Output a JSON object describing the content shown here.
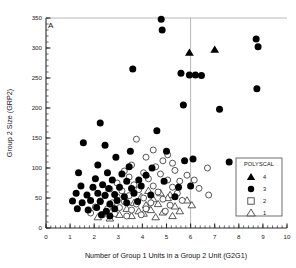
{
  "panel": {
    "label": "A"
  },
  "chart_data": {
    "type": "scatter",
    "title": "",
    "xlabel": "Number of Group 1 Units in a Group 2 Unit (G2G1)",
    "ylabel": "Group 2 Size (GRP2)",
    "xlim": [
      0,
      10
    ],
    "ylim": [
      0,
      350
    ],
    "xticks": [
      0,
      1,
      2,
      3,
      4,
      5,
      6,
      7,
      8,
      9,
      10
    ],
    "yticks": [
      0,
      50,
      100,
      150,
      200,
      250,
      300,
      350
    ],
    "xtick_labels": [
      "0",
      "1",
      "2",
      "3",
      "4",
      "5",
      "6",
      "7",
      "8",
      "9",
      "10"
    ],
    "ytick_labels": [
      "0",
      "50",
      "100",
      "150",
      "200",
      "250",
      "300",
      "350"
    ],
    "xminor_step": 0.2,
    "yminor_step": 10,
    "grid": false,
    "reference_lines": [
      {
        "orientation": "vertical",
        "x": 6,
        "color": "#b0b0b0"
      }
    ],
    "legend": {
      "title": "POLYSCAL",
      "position": "lower-right",
      "entries": [
        {
          "label": "4",
          "marker": "filled-triangle",
          "color": "#000000"
        },
        {
          "label": "3",
          "marker": "filled-circle",
          "color": "#000000"
        },
        {
          "label": "2",
          "marker": "open-square",
          "color": "#ffffff"
        },
        {
          "label": "1",
          "marker": "open-triangle",
          "color": "#ffffff"
        }
      ]
    },
    "series": [
      {
        "name": "4",
        "marker": "filled-triangle",
        "points": [
          [
            5.95,
            292
          ],
          [
            7.0,
            297
          ]
        ]
      },
      {
        "name": "3",
        "marker": "filled-circle",
        "points": [
          [
            4.78,
            348
          ],
          [
            4.82,
            330
          ],
          [
            8.72,
            315
          ],
          [
            8.8,
            302
          ],
          [
            3.6,
            265
          ],
          [
            5.6,
            258
          ],
          [
            5.95,
            255
          ],
          [
            6.2,
            255
          ],
          [
            6.45,
            254
          ],
          [
            8.75,
            232
          ],
          [
            5.7,
            205
          ],
          [
            7.2,
            198
          ],
          [
            2.25,
            175
          ],
          [
            4.6,
            162
          ],
          [
            1.55,
            142
          ],
          [
            2.45,
            138
          ],
          [
            3.5,
            128
          ],
          [
            5.0,
            128
          ],
          [
            2.9,
            118
          ],
          [
            5.75,
            112
          ],
          [
            6.1,
            115
          ],
          [
            7.6,
            110
          ],
          [
            2.15,
            105
          ],
          [
            3.45,
            102
          ],
          [
            4.4,
            100
          ],
          [
            1.35,
            92
          ],
          [
            2.55,
            92
          ],
          [
            3.15,
            90
          ],
          [
            4.15,
            88
          ],
          [
            2.05,
            82
          ],
          [
            2.75,
            80
          ],
          [
            3.35,
            78
          ],
          [
            3.85,
            80
          ],
          [
            4.9,
            78
          ],
          [
            1.45,
            70
          ],
          [
            1.95,
            68
          ],
          [
            2.35,
            72
          ],
          [
            2.6,
            66
          ],
          [
            3.05,
            68
          ],
          [
            3.55,
            66
          ],
          [
            3.95,
            70
          ],
          [
            5.5,
            68
          ],
          [
            6.0,
            70
          ],
          [
            1.25,
            58
          ],
          [
            1.7,
            55
          ],
          [
            2.15,
            58
          ],
          [
            2.45,
            54
          ],
          [
            2.85,
            56
          ],
          [
            3.25,
            52
          ],
          [
            3.65,
            58
          ],
          [
            4.35,
            55
          ],
          [
            5.35,
            52
          ],
          [
            1.1,
            45
          ],
          [
            1.5,
            42
          ],
          [
            1.85,
            46
          ],
          [
            2.25,
            44
          ],
          [
            2.65,
            40
          ],
          [
            2.95,
            46
          ],
          [
            3.35,
            42
          ],
          [
            3.8,
            44
          ],
          [
            1.3,
            32
          ],
          [
            1.75,
            30
          ],
          [
            2.1,
            34
          ],
          [
            2.5,
            28
          ],
          [
            2.85,
            32
          ],
          [
            2.3,
            22
          ],
          [
            2.65,
            20
          ]
        ]
      },
      {
        "name": "2",
        "marker": "open-circle",
        "points": [
          [
            3.75,
            148
          ],
          [
            4.45,
            130
          ],
          [
            5.05,
            122
          ],
          [
            4.15,
            118
          ],
          [
            4.85,
            112
          ],
          [
            5.25,
            108
          ],
          [
            3.55,
            105
          ],
          [
            4.55,
            102
          ],
          [
            6.7,
            100
          ],
          [
            5.35,
            96
          ],
          [
            3.25,
            95
          ],
          [
            4.05,
            92
          ],
          [
            4.75,
            90
          ],
          [
            5.85,
            88
          ],
          [
            3.45,
            85
          ],
          [
            4.25,
            82
          ],
          [
            5.05,
            80
          ],
          [
            5.55,
            78
          ],
          [
            6.15,
            80
          ],
          [
            2.95,
            75
          ],
          [
            3.65,
            72
          ],
          [
            4.45,
            70
          ],
          [
            5.25,
            68
          ],
          [
            6.35,
            66
          ],
          [
            2.65,
            65
          ],
          [
            3.15,
            62
          ],
          [
            3.85,
            64
          ],
          [
            4.65,
            60
          ],
          [
            5.45,
            58
          ],
          [
            6.75,
            55
          ],
          [
            2.45,
            55
          ],
          [
            2.95,
            52
          ],
          [
            3.45,
            54
          ],
          [
            4.05,
            50
          ],
          [
            4.85,
            48
          ],
          [
            5.65,
            46
          ],
          [
            2.25,
            45
          ],
          [
            2.75,
            42
          ],
          [
            3.25,
            44
          ],
          [
            3.75,
            40
          ],
          [
            4.35,
            42
          ],
          [
            5.15,
            38
          ],
          [
            2.05,
            35
          ],
          [
            2.55,
            32
          ],
          [
            3.05,
            34
          ],
          [
            3.55,
            30
          ],
          [
            4.15,
            32
          ],
          [
            4.95,
            28
          ],
          [
            1.85,
            25
          ],
          [
            2.35,
            22
          ],
          [
            2.85,
            24
          ],
          [
            3.35,
            20
          ],
          [
            3.95,
            22
          ]
        ]
      },
      {
        "name": "1",
        "marker": "open-triangle",
        "points": [
          [
            4.25,
            62
          ],
          [
            4.75,
            58
          ],
          [
            5.15,
            55
          ],
          [
            3.95,
            52
          ],
          [
            4.45,
            48
          ],
          [
            5.05,
            50
          ],
          [
            5.85,
            46
          ],
          [
            3.65,
            42
          ],
          [
            4.15,
            38
          ],
          [
            4.65,
            40
          ],
          [
            5.35,
            36
          ],
          [
            6.05,
            38
          ],
          [
            3.35,
            32
          ],
          [
            3.85,
            28
          ],
          [
            4.35,
            30
          ],
          [
            4.85,
            26
          ],
          [
            5.55,
            28
          ],
          [
            3.05,
            22
          ],
          [
            3.55,
            20
          ],
          [
            4.05,
            24
          ],
          [
            4.55,
            18
          ],
          [
            5.25,
            20
          ],
          [
            2.15,
            18
          ],
          [
            2.65,
            16
          ]
        ]
      }
    ]
  }
}
